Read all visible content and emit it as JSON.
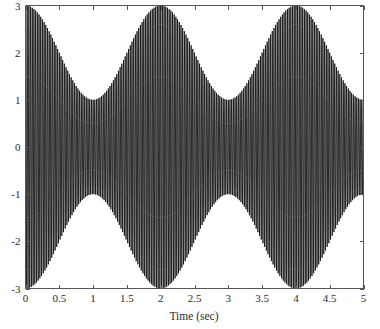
{
  "chart_data": {
    "type": "line",
    "title": "",
    "subtitle": "",
    "xlabel": "Time (sec)",
    "ylabel": "",
    "xlim": [
      0,
      5
    ],
    "ylim": [
      -3,
      3
    ],
    "grid": false,
    "legend": null,
    "x_ticks": [
      0,
      0.5,
      1,
      1.5,
      2,
      2.5,
      3,
      3.5,
      4,
      4.5,
      5
    ],
    "x_tick_labels": [
      "0",
      "0.5",
      "1",
      "1.5",
      "2",
      "2.5",
      "3",
      "3.5",
      "4",
      "4.5",
      "5"
    ],
    "y_ticks": [
      -3,
      -2,
      -1,
      0,
      1,
      2,
      3
    ],
    "y_tick_labels": [
      "-3",
      "-2",
      "-1",
      "0",
      "1",
      "2",
      "3"
    ],
    "series": [
      {
        "name": "amplitude-modulated-signal",
        "color": "#111111",
        "description": "Amplitude modulated waveform: high frequency carrier whose envelope is 2 + cos(pi*t)",
        "envelope_formula": "2 + cos(pi*t)",
        "carrier_formula": "cos(2*pi*fc*t)",
        "carrier_frequency_hz": 40,
        "envelope_frequency_hz": 0.5,
        "envelope_max": 3,
        "envelope_min": 1,
        "envelope_peaks_at": [
          0,
          2,
          4
        ],
        "envelope_minima_at": [
          1,
          3
        ],
        "sample_count": 2400
      }
    ],
    "annotations": []
  },
  "axes": {
    "x_axis_name": "time-axis",
    "y_axis_name": "amplitude-axis",
    "box_style": "open-left-bottom",
    "tick_direction": "in"
  },
  "colors": {
    "signal": "#111111",
    "axis": "#555555",
    "text": "#2b2b2b",
    "background": "#ffffff"
  }
}
